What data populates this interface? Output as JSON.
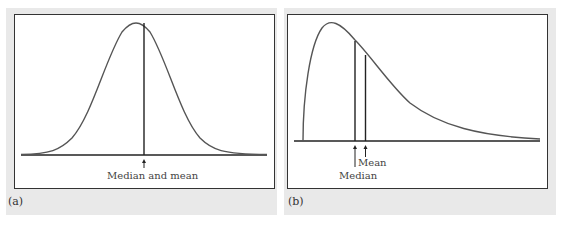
{
  "panels": [
    {
      "id": "a",
      "label": "(a)",
      "annotation": "Median and mean",
      "distribution": "symmetric"
    },
    {
      "id": "b",
      "label": "(b)",
      "annotation_mean": "Mean",
      "annotation_median": "Median",
      "distribution": "right-skewed"
    }
  ],
  "colors": {
    "panel_bg": "#e9e9e9",
    "curve": "#555555",
    "axis": "#222222"
  }
}
